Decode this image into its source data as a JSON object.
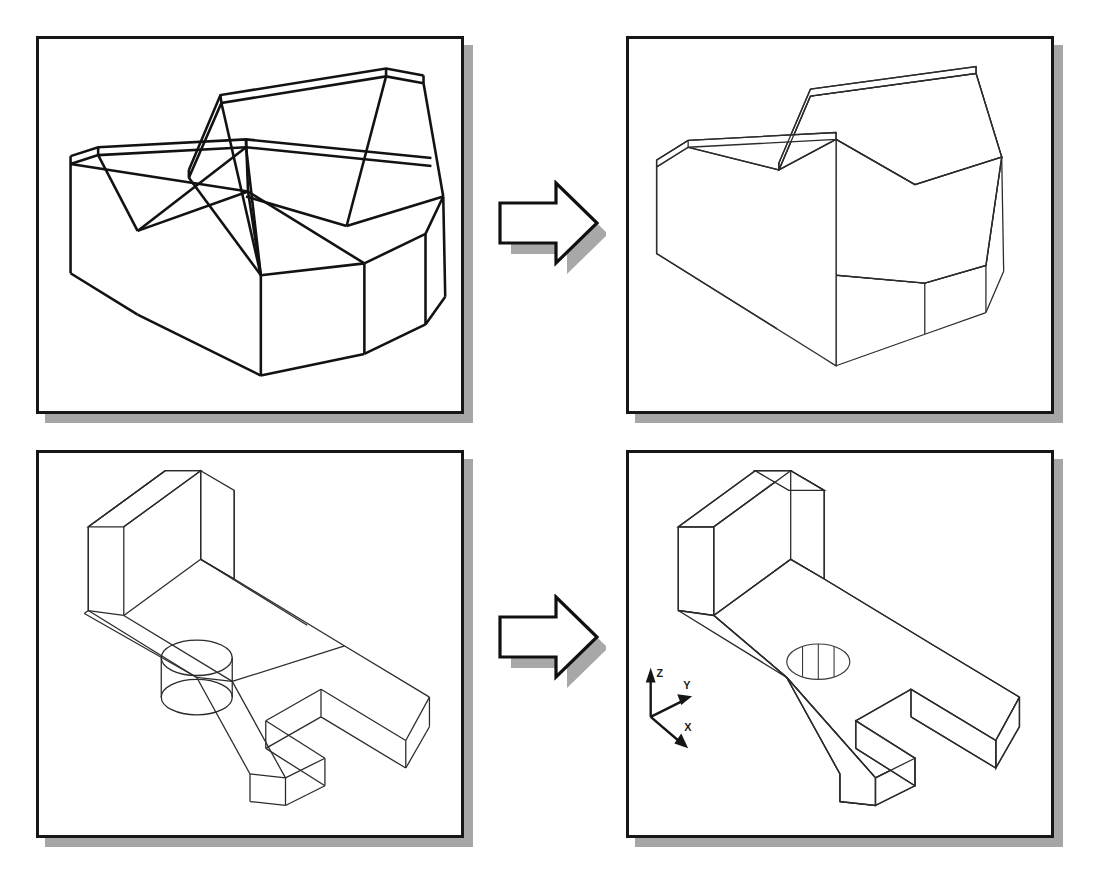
{
  "figure": {
    "background_color": "#ffffff",
    "line_color": "#1a1a1a",
    "shadow_color": "#a6a6a6"
  },
  "panels": [
    {
      "id": "panel-top-left",
      "name": "wireframe-wedge-block",
      "role": "before",
      "mode": "wireframe",
      "caption": "",
      "x": 36,
      "y": 36,
      "width": 428,
      "height": 378
    },
    {
      "id": "panel-top-right",
      "name": "hidden-wedge-block",
      "role": "after",
      "mode": "hidden-line-removed",
      "caption": "",
      "x": 626,
      "y": 36,
      "width": 428,
      "height": 378
    },
    {
      "id": "panel-bottom-left",
      "name": "wireframe-angle-bracket",
      "role": "before",
      "mode": "wireframe",
      "caption": "",
      "x": 36,
      "y": 450,
      "width": 428,
      "height": 388
    },
    {
      "id": "panel-bottom-right",
      "name": "hidden-angle-bracket",
      "role": "after",
      "mode": "hidden-line-removed",
      "caption": "",
      "x": 626,
      "y": 450,
      "width": 428,
      "height": 388
    }
  ],
  "arrows": [
    {
      "id": "arrow-top",
      "name": "transform-arrow-top",
      "direction": "right",
      "x": 496,
      "y": 180,
      "width": 100,
      "height": 88
    },
    {
      "id": "arrow-bottom",
      "name": "transform-arrow-bottom",
      "direction": "right",
      "x": 496,
      "y": 594,
      "width": 100,
      "height": 88
    }
  ],
  "ucs_icon": {
    "name": "ucs-axis-indicator",
    "visible_in": "panel-bottom-right",
    "axes": [
      {
        "label": "Z",
        "direction": "up"
      },
      {
        "label": "Y",
        "direction": "upper-right"
      },
      {
        "label": "X",
        "direction": "lower-right"
      }
    ]
  },
  "chart_data": {
    "type": "diagram",
    "panel_count": 4,
    "pairs": [
      {
        "before": "wireframe-wedge-block",
        "after": "hidden-wedge-block",
        "operation": "hide"
      },
      {
        "before": "wireframe-angle-bracket",
        "after": "hidden-angle-bracket",
        "operation": "hide"
      }
    ]
  }
}
